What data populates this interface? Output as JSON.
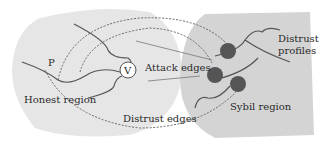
{
  "diagram": {
    "labels": {
      "p_node": "P",
      "v_node": "V",
      "attack_edges": "Attack edges",
      "honest_region": "Honest region",
      "distrust_edges": "Distrust edges",
      "distrust_profiles_line1": "Distrust",
      "distrust_profiles_line2": "profiles",
      "sybil_region": "Sybil region"
    },
    "colors": {
      "region_fill": "#e4e4e4",
      "sybil_region_fill": "#d2d2d2",
      "edge_stroke": "#555555",
      "dashed_edge": "#666666",
      "sybil_node_fill": "#555555",
      "v_node_fill": "#ffffff"
    }
  }
}
